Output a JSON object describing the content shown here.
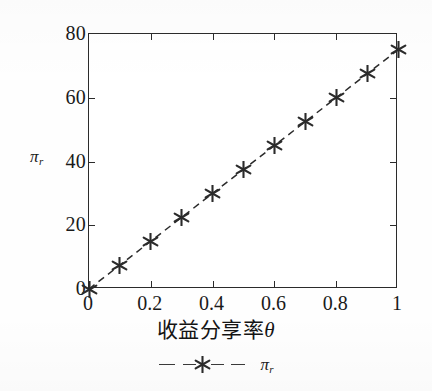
{
  "chart_data": {
    "type": "line",
    "title": "",
    "subtitle": "",
    "xlabel": "收益分享率θ",
    "ylabel": "πr",
    "ylabel_base": "π",
    "ylabel_sub": "r",
    "xlim": [
      0,
      1
    ],
    "ylim": [
      0,
      80
    ],
    "grid": false,
    "legend_position": "bottom",
    "x": [
      0,
      0.1,
      0.2,
      0.3,
      0.4,
      0.5,
      0.6,
      0.7,
      0.8,
      0.9,
      1
    ],
    "series": [
      {
        "name": "πr",
        "name_base": "π",
        "name_sub": "r",
        "marker": "asterisk",
        "linestyle": "dashed",
        "color": "#2b2b2b",
        "values": [
          0,
          7.5,
          15,
          22.5,
          30,
          37.5,
          45,
          52.5,
          60,
          67.5,
          75
        ]
      }
    ],
    "x_tick_labels": [
      "0",
      "0.2",
      "0.4",
      "0.6",
      "0.8",
      "1"
    ],
    "x_tick_values": [
      0,
      0.2,
      0.4,
      0.6,
      0.8,
      1
    ],
    "y_tick_labels": [
      "0",
      "20",
      "40",
      "60",
      "80"
    ],
    "y_tick_values": [
      0,
      20,
      40,
      60,
      80
    ],
    "annotations": []
  },
  "legend": {
    "entry_label": "πr",
    "entry_label_base": "π",
    "entry_label_sub": "r",
    "marker_icon": "asterisk-marker-icon",
    "line_style": "dashed"
  },
  "colors": {
    "axis": "#2b2b2b",
    "series": "#2b2b2b",
    "background": "#fefefe",
    "text": "#1a1a1a"
  }
}
